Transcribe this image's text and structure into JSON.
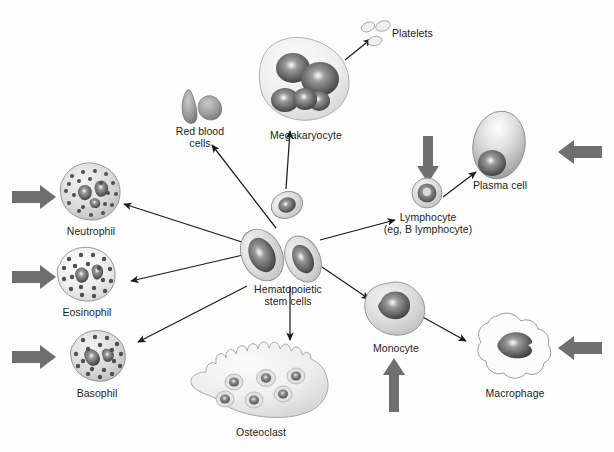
{
  "diagram": {
    "background_color": "#fdfdfd",
    "text_color": "#1d1d1d",
    "cell_fill_light": "#d9d9d9",
    "cell_fill_mid": "#b4b4b4",
    "nucleus_dark": "#4a4a4a",
    "thin_arrow_color": "#1d1d1d",
    "thick_arrow_color": "#6f6f6f"
  },
  "labels": {
    "red_blood_cells": "Red blood\ncells",
    "megakaryocyte": "Megakaryocyte",
    "platelets": "Platelets",
    "plasma_cell": "Plasma cell",
    "lymphocyte": "Lymphocyte\n(eg, B lymphocyte)",
    "neutrophil": "Neutrophil",
    "eosinophil": "Eosinophil",
    "basophil": "Basophil",
    "hematopoietic_stem_cells": "Hematopoietic\nstem cells",
    "osteoclast": "Osteoclast",
    "monocyte": "Monocyte",
    "macrophage": "Macrophage"
  },
  "cells": [
    {
      "name": "red-blood-cells",
      "label": "Red blood\ncells",
      "x": 200,
      "y": 104
    },
    {
      "name": "megakaryocyte",
      "label": "Megakaryocyte",
      "x": 305,
      "y": 90
    },
    {
      "name": "platelets",
      "label": "Platelets",
      "x": 378,
      "y": 32
    },
    {
      "name": "plasma-cell",
      "label": "Plasma cell",
      "x": 500,
      "y": 155
    },
    {
      "name": "lymphocyte",
      "label": "Lymphocyte\n(eg, B lymphocyte)",
      "x": 427,
      "y": 205
    },
    {
      "name": "neutrophil",
      "label": "Neutrophil",
      "x": 88,
      "y": 195
    },
    {
      "name": "eosinophil",
      "label": "Eosinophil",
      "x": 82,
      "y": 275
    },
    {
      "name": "basophil",
      "label": "Basophil",
      "x": 96,
      "y": 355
    },
    {
      "name": "hematopoietic-stem-cells",
      "label": "Hematopoietic\nstem cells",
      "x": 288,
      "y": 250
    },
    {
      "name": "osteoclast",
      "label": "Osteoclast",
      "x": 258,
      "y": 395
    },
    {
      "name": "monocyte",
      "label": "Monocyte",
      "x": 393,
      "y": 318
    },
    {
      "name": "macrophage",
      "label": "Macrophage",
      "x": 512,
      "y": 368
    }
  ],
  "thick_arrows": [
    {
      "name": "neutrophil-input-arrow",
      "direction": "right"
    },
    {
      "name": "eosinophil-input-arrow",
      "direction": "right"
    },
    {
      "name": "basophil-input-arrow",
      "direction": "right"
    },
    {
      "name": "plasma-cell-input-arrow",
      "direction": "left"
    },
    {
      "name": "macrophage-input-arrow",
      "direction": "left"
    },
    {
      "name": "lymphocyte-input-arrow",
      "direction": "down"
    },
    {
      "name": "monocyte-input-arrow",
      "direction": "up"
    }
  ],
  "flow_arrows": [
    {
      "name": "stem-to-red-blood-cells",
      "from": "hematopoietic-stem-cells",
      "to": "red-blood-cells"
    },
    {
      "name": "precursor-to-megakaryocyte",
      "from": "megakaryocyte-precursor",
      "to": "megakaryocyte"
    },
    {
      "name": "megakaryocyte-to-platelets",
      "from": "megakaryocyte",
      "to": "platelets"
    },
    {
      "name": "stem-to-neutrophil",
      "from": "hematopoietic-stem-cells",
      "to": "neutrophil"
    },
    {
      "name": "stem-to-eosinophil",
      "from": "hematopoietic-stem-cells",
      "to": "eosinophil"
    },
    {
      "name": "stem-to-basophil",
      "from": "hematopoietic-stem-cells",
      "to": "basophil"
    },
    {
      "name": "stem-to-lymphocyte",
      "from": "hematopoietic-stem-cells",
      "to": "lymphocyte"
    },
    {
      "name": "lymphocyte-to-plasma-cell",
      "from": "lymphocyte",
      "to": "plasma-cell"
    },
    {
      "name": "stem-to-monocyte",
      "from": "hematopoietic-stem-cells",
      "to": "monocyte"
    },
    {
      "name": "monocyte-to-macrophage",
      "from": "monocyte",
      "to": "macrophage"
    },
    {
      "name": "stem-to-osteoclast",
      "from": "hematopoietic-stem-cells",
      "to": "osteoclast"
    }
  ]
}
